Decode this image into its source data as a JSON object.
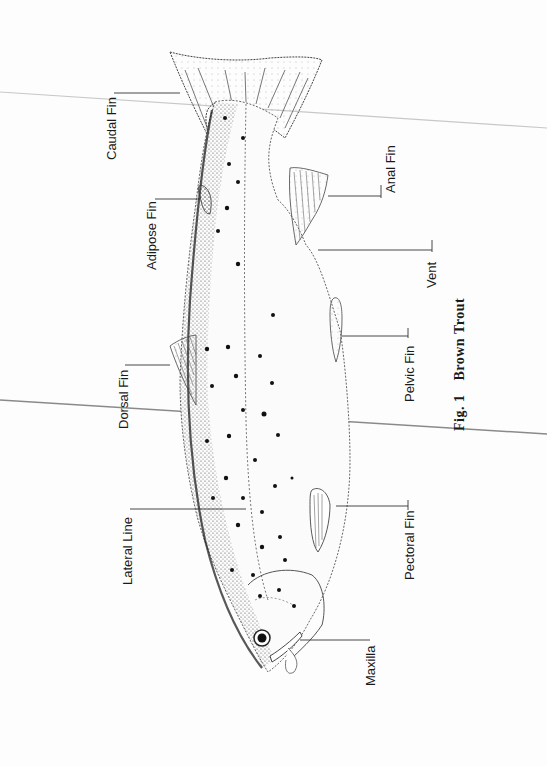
{
  "figure": {
    "caption_prefix": "Fig. 1",
    "caption_title": "Brown Trout"
  },
  "labels": {
    "caudal_fin": "Caudal Fin",
    "adipose_fin": "Adipose Fin",
    "dorsal_fin": "Dorsal Fin",
    "lateral_line": "Lateral Line",
    "maxilla": "Maxilla",
    "anal_fin": "Anal Fin",
    "vent": "Vent",
    "pelvic_fin": "Pelvic Fin",
    "pectoral_fin": "Pectoral Fin"
  },
  "colors": {
    "ink": "#1a1a1a",
    "paper": "#fdfdfd",
    "scan_line": "#9a9a9a"
  }
}
